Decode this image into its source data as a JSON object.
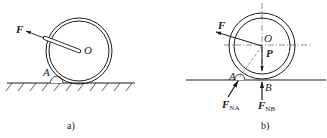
{
  "figure_a": {
    "caption": "a)",
    "labels": {
      "force": "F",
      "center": "O",
      "contact": "A"
    }
  },
  "figure_b": {
    "caption": "b)",
    "labels": {
      "force": "F",
      "center": "O",
      "weight": "P",
      "contact_a": "A",
      "contact_b": "B",
      "normal_a_main": "F",
      "normal_a_sub": "NA",
      "normal_b_main": "F",
      "normal_b_sub": "NB"
    }
  },
  "colors": {
    "ink": "#1a1a1a",
    "background": "#ffffff"
  }
}
